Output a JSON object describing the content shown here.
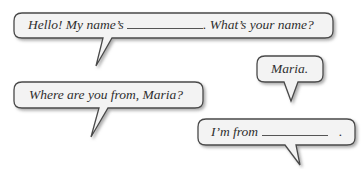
{
  "bubbles": [
    {
      "id": "greeting",
      "before_blank": "Hello! My name’s",
      "after_blank": ". What’s your name?"
    },
    {
      "id": "answer-name",
      "text": "Maria."
    },
    {
      "id": "question-origin",
      "text": "Where are you from, Maria?"
    },
    {
      "id": "answer-origin",
      "before_blank": "I’m from",
      "after_blank": "."
    }
  ],
  "colors": {
    "bubble_fill": "#f3f3f3",
    "bubble_stroke": "#4a4a4a",
    "shadow": "#9a9a9a",
    "text": "#2f2f2f"
  }
}
